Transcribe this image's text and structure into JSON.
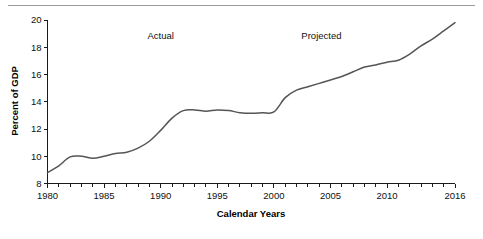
{
  "chart_data": {
    "type": "line",
    "title": "",
    "xlabel": "Calendar Years",
    "ylabel": "Percent of GDP",
    "xlim": [
      1980,
      2016
    ],
    "ylim": [
      8,
      20
    ],
    "grid": false,
    "legend_position": "none",
    "x_tick_labels": [
      "1980",
      "1985",
      "1990",
      "1995",
      "2000",
      "2005",
      "2010",
      "2016"
    ],
    "x_tick_values": [
      1980,
      1985,
      1990,
      1995,
      2000,
      2005,
      2010,
      2016
    ],
    "x_minor_ticks": [
      1981,
      1982,
      1983,
      1984,
      1986,
      1987,
      1988,
      1989,
      1991,
      1992,
      1993,
      1994,
      1996,
      1997,
      1998,
      1999,
      2001,
      2002,
      2003,
      2004,
      2006,
      2007,
      2008,
      2009,
      2011,
      2012,
      2013,
      2014,
      2015
    ],
    "y_tick_labels": [
      "8",
      "10",
      "12",
      "14",
      "16",
      "18",
      "20"
    ],
    "y_tick_values": [
      8,
      10,
      12,
      14,
      16,
      18,
      20
    ],
    "annotations": [
      {
        "text": "Actual",
        "x": 1990,
        "y": 18.6
      },
      {
        "text": "Projected",
        "x": 2004.2,
        "y": 18.6
      }
    ],
    "line_color": "#555555",
    "axis_color": "#1a1a1a",
    "series": [
      {
        "name": "Percent of GDP",
        "x": [
          1980,
          1981,
          1982,
          1983,
          1984,
          1985,
          1986,
          1987,
          1988,
          1989,
          1990,
          1991,
          1992,
          1993,
          1994,
          1995,
          1996,
          1997,
          1998,
          1999,
          2000,
          2001,
          2002,
          2003,
          2004,
          2005,
          2006,
          2007,
          2008,
          2009,
          2010,
          2011,
          2012,
          2013,
          2014,
          2015,
          2016
        ],
        "values": [
          8.8,
          9.3,
          9.95,
          10.0,
          9.85,
          10.0,
          10.2,
          10.3,
          10.6,
          11.1,
          11.9,
          12.8,
          13.35,
          13.4,
          13.3,
          13.4,
          13.35,
          13.2,
          13.15,
          13.2,
          13.25,
          14.3,
          14.85,
          15.1,
          15.35,
          15.6,
          15.85,
          16.2,
          16.55,
          16.7,
          16.9,
          17.05,
          17.5,
          18.1,
          18.6,
          19.2,
          19.8
        ]
      }
    ]
  },
  "figure": {
    "has_top_rule": true
  }
}
